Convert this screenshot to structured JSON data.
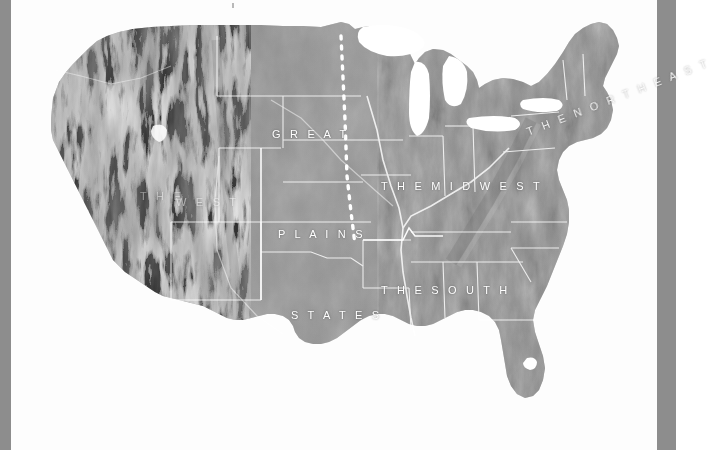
{
  "figure": {
    "kind": "relief-map",
    "background_color": "#fdfdfd",
    "land_tone": "#8e8e8e",
    "water_color": "#ffffff",
    "boundary_color": "#ffffff",
    "edge_bar_color": "#8d8d8d"
  },
  "labels": {
    "great": "G R E A T",
    "plains": "P L A I N S",
    "states": "S T A T E S",
    "midwest": "T H E   M I D W E S T",
    "south": "T H E   S O U T H",
    "northeast": "T H E   N O R T H E A S T",
    "west_the": "T H E",
    "west": "W E S T"
  },
  "regions": [
    {
      "name": "The West",
      "label_lines": [
        "THE",
        "WEST"
      ],
      "style": "faint"
    },
    {
      "name": "Great Plains States",
      "label_lines": [
        "GREAT",
        "PLAINS",
        "STATES"
      ],
      "style": "stacked"
    },
    {
      "name": "The Midwest",
      "label_lines": [
        "THE MIDWEST"
      ],
      "style": "single"
    },
    {
      "name": "The South",
      "label_lines": [
        "THE SOUTH"
      ],
      "style": "single"
    },
    {
      "name": "The Northeast",
      "label_lines": [
        "THE NORTHEAST"
      ],
      "style": "rotated"
    }
  ],
  "map_features": {
    "dotted_divider": "dotted white line marking eastern edge of the Great Plains",
    "state_borders": "thin white state boundary lines",
    "great_lakes": "white water bodies (Superior, Michigan, Huron, Erie, Ontario)",
    "lake_okeechobee": "small white lake in southern Florida",
    "mountain_shading": "high-contrast hillshade over the Rocky Mountains and Appalachians"
  },
  "edges": {
    "left_bar_width_px": 11,
    "right_bar_start_px": 657,
    "bar_color": "#8d8d8d"
  }
}
